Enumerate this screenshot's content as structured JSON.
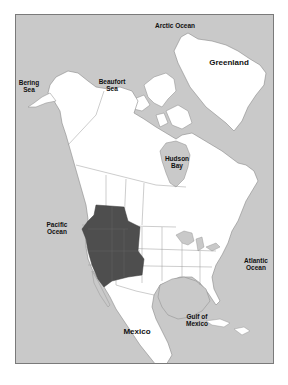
{
  "map": {
    "title": "",
    "colors": {
      "ocean": "#c9c9c9",
      "land": "#ffffff",
      "border": "#8a8a8a",
      "highlight": "#4e4e4e",
      "frame": "#7a7a7a"
    },
    "labels": {
      "arctic_ocean": "Arctic Ocean",
      "greenland": "Greenland",
      "bering_sea": "Bering\nSea",
      "beaufort_sea": "Beaufort\nSea",
      "hudson_bay": "Hudson\nBay",
      "pacific_ocean": "Pacific\nOcean",
      "atlantic_ocean": "Atlantic\nOcean",
      "gulf_of_mexico": "Gulf of\nMexico",
      "mexico": "Mexico"
    },
    "highlighted_region": "Great Basin / Intermountain West (Nevada, Utah, Idaho, Oregon, western Colorado)"
  }
}
